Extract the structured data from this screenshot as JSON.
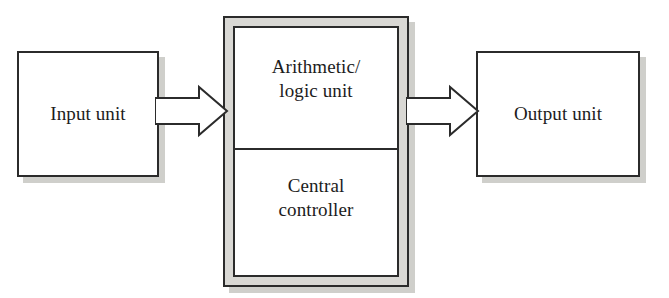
{
  "diagram": {
    "type": "block-diagram",
    "background_color": "#ffffff",
    "line_color": "#2b2b2b",
    "frame_fill_color": "#d9d8d4",
    "shadow_color": "#cfcfcb",
    "nodes": [
      {
        "id": "input-unit",
        "label": "Input unit",
        "shape": "rectangle",
        "fill": "#ffffff",
        "has_shadow": true
      },
      {
        "id": "cpu",
        "label": "",
        "shape": "nested-rectangle",
        "fill": "#d9d8d4",
        "has_shadow": true,
        "cells": [
          {
            "id": "arithmetic-logic-unit",
            "label": "Arithmetic/\nlogic unit",
            "fill": "#ffffff"
          },
          {
            "id": "central-controller",
            "label": "Central\ncontroller",
            "fill": "#ffffff"
          }
        ]
      },
      {
        "id": "output-unit",
        "label": "Output unit",
        "shape": "rectangle",
        "fill": "#ffffff",
        "has_shadow": true
      }
    ],
    "edges": [
      {
        "id": "arrow-input-to-cpu",
        "from": "input-unit",
        "to": "cpu",
        "style": "block-arrow",
        "direction": "right",
        "label": ""
      },
      {
        "id": "arrow-cpu-to-output",
        "from": "cpu",
        "to": "output-unit",
        "style": "block-arrow",
        "direction": "right",
        "label": ""
      }
    ]
  }
}
